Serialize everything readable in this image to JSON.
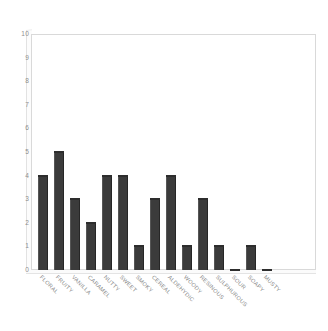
{
  "chart_data": {
    "type": "bar",
    "title": "",
    "subtitle": "",
    "xlabel": "",
    "ylabel": "",
    "ylim": [
      0,
      10
    ],
    "ytick_step": 1,
    "yticks": [
      "10",
      "9",
      "8",
      "7",
      "6",
      "5",
      "4",
      "3",
      "2",
      "1",
      "0"
    ],
    "grid": false,
    "legend": false,
    "legend_position": "none",
    "categories": [
      "FLORAL",
      "FRUITY",
      "VANILLA",
      "CARAMEL",
      "NUTTY",
      "SWEET",
      "SMOKY",
      "CEREAL",
      "ALDEHYDIC",
      "WOODY",
      "RESINOUS",
      "SULPHUROUS",
      "SOUR",
      "SOAPY",
      "MUSTY"
    ],
    "values": [
      4,
      5,
      3,
      2,
      4,
      4,
      1,
      3,
      4,
      1,
      3,
      1,
      0,
      1,
      0
    ],
    "bar_color": "#3b3b3b",
    "bar_top_color": "#6e6e6e",
    "frame_color": "#d9d9d9",
    "tick_text_color": "#8d8d8d",
    "label_text_color": "#8a8a8a",
    "background_color": "#ffffff"
  }
}
